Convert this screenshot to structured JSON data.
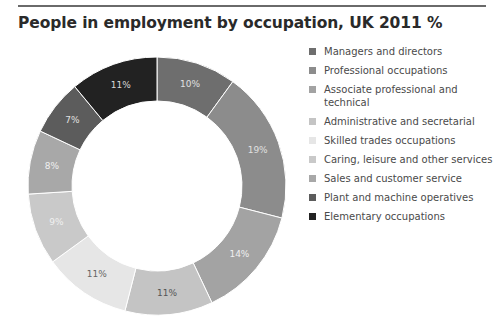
{
  "title": "People in employment by occupation, UK 2011 %",
  "chart_data": {
    "type": "pie",
    "subtype": "donut",
    "title": "People in employment by occupation, UK 2011 %",
    "categories": [
      "Managers and directors",
      "Professional occupations",
      "Associate professional and technical",
      "Administrative and secretarial",
      "Skilled trades occupations",
      "Caring, leisure and other services",
      "Sales and customer service",
      "Plant and machine operatives",
      "Elementary occupations"
    ],
    "values": [
      10,
      19,
      14,
      11,
      11,
      9,
      8,
      7,
      11
    ],
    "labels": [
      "10%",
      "19%",
      "14%",
      "11%",
      "11%",
      "9%",
      "8%",
      "7%",
      "11%"
    ],
    "colors": [
      "#6e6e6e",
      "#8c8c8c",
      "#a3a3a3",
      "#c4c4c4",
      "#e6e6e6",
      "#c9c9c9",
      "#a8a8a8",
      "#5c5c5c",
      "#222222"
    ],
    "label_colors": [
      "#e0e0e0",
      "#e0e0e0",
      "#f0f0f0",
      "#555555",
      "#666666",
      "#f0f0f0",
      "#f0f0f0",
      "#e0e0e0",
      "#d8d8d8"
    ],
    "start_angle": "top, clockwise",
    "legend_position": "right"
  },
  "legend": {
    "items": [
      {
        "label": "Managers and directors",
        "color": "#6e6e6e"
      },
      {
        "label": "Professional occupations",
        "color": "#8c8c8c"
      },
      {
        "label": "Associate professional and technical",
        "color": "#a3a3a3"
      },
      {
        "label": "Administrative and secretarial",
        "color": "#c4c4c4"
      },
      {
        "label": "Skilled trades occupations",
        "color": "#e6e6e6"
      },
      {
        "label": "Caring, leisure and other services",
        "color": "#c9c9c9"
      },
      {
        "label": "Sales and customer service",
        "color": "#a8a8a8"
      },
      {
        "label": "Plant and machine operatives",
        "color": "#5c5c5c"
      },
      {
        "label": "Elementary occupations",
        "color": "#222222"
      }
    ]
  }
}
